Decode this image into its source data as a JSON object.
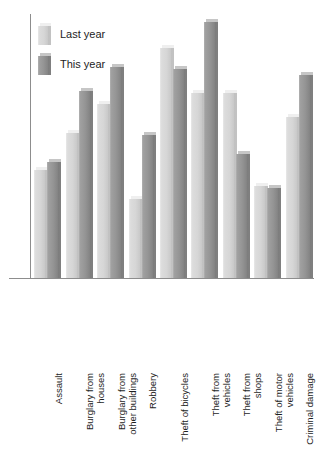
{
  "chart_data": {
    "type": "bar",
    "title": "",
    "subtitle": "",
    "xlabel": "",
    "ylabel": "",
    "grid": false,
    "legend_position": "top-left",
    "axis_color": "#8d8d8d",
    "ylim": [
      0,
      100
    ],
    "categories": [
      "Assault",
      "Burglary from\nhouses",
      "Burglary from\nother buildings",
      "Robbery",
      "Theft of bicycles",
      "Theft from\nvehicles",
      "Theft from\nshops",
      "Theft of motor\nvehicles",
      "Criminal damage"
    ],
    "series": [
      {
        "name": "Last year",
        "color": "#d6d6d6",
        "values": [
          41,
          55,
          66,
          30,
          87,
          70,
          70,
          35,
          61
        ]
      },
      {
        "name": "This year",
        "color": "#959595",
        "values": [
          44,
          71,
          80,
          54,
          79,
          97,
          47,
          34,
          77
        ]
      }
    ]
  },
  "legend": {
    "items": [
      {
        "label": "Last year",
        "swatch": "light-swatch"
      },
      {
        "label": "This year",
        "swatch": "dark-swatch"
      }
    ]
  },
  "axis": {
    "category_labels": [
      "Assault",
      "Burglary from\nhouses",
      "Burglary from\nother buildings",
      "Robbery",
      "Theft of bicycles",
      "Theft from\nvehicles",
      "Theft from\nshops",
      "Theft of motor\nvehicles",
      "Criminal damage"
    ]
  }
}
